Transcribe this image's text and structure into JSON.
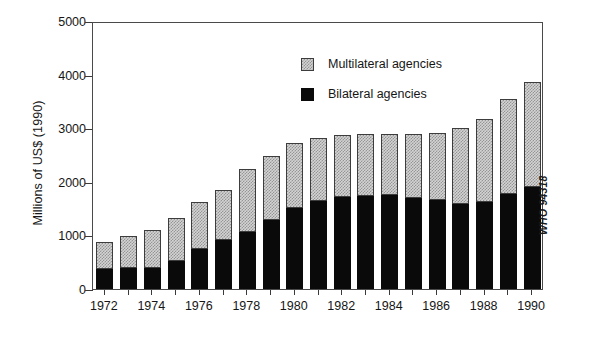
{
  "chart_data": {
    "type": "bar",
    "subtype": "stacked-bar",
    "title": "",
    "xlabel": "",
    "ylabel": "Millions of US$ (1990)",
    "ylim": [
      0,
      5000
    ],
    "ytick_values": [
      0,
      1000,
      2000,
      3000,
      4000,
      5000
    ],
    "ytick_labels": [
      "0",
      "1000",
      "2000",
      "3000",
      "4000",
      "5000"
    ],
    "grid": false,
    "legend_position": "top-center",
    "categories": [
      1972,
      1973,
      1974,
      1975,
      1976,
      1977,
      1978,
      1979,
      1980,
      1981,
      1982,
      1983,
      1984,
      1985,
      1986,
      1987,
      1988,
      1989,
      1990
    ],
    "xtick_labels": [
      "1972",
      "1974",
      "1976",
      "1978",
      "1980",
      "1982",
      "1984",
      "1986",
      "1988",
      "1990"
    ],
    "xtick_categories": [
      1972,
      1974,
      1976,
      1978,
      1980,
      1982,
      1984,
      1986,
      1988,
      1990
    ],
    "series": [
      {
        "name": "Bilateral agencies",
        "color": "#0a0a0a",
        "values": [
          380,
          390,
          400,
          530,
          740,
          910,
          1060,
          1290,
          1520,
          1650,
          1710,
          1740,
          1750,
          1700,
          1660,
          1590,
          1630,
          1770,
          1910
        ]
      },
      {
        "name": "Multilateral agencies",
        "color": "#d3d3d3",
        "values": [
          500,
          600,
          700,
          800,
          880,
          940,
          1180,
          1190,
          1200,
          1170,
          1160,
          1150,
          1140,
          1190,
          1260,
          1420,
          1550,
          1780,
          1960
        ]
      }
    ],
    "totals": [
      880,
      990,
      1100,
      1330,
      1620,
      1850,
      2240,
      2480,
      2720,
      2820,
      2870,
      2890,
      2890,
      2890,
      2920,
      3010,
      3180,
      3550,
      3870
    ],
    "annotations": [
      {
        "name": "source-code",
        "text": "WHO 94318",
        "orientation": "vertical"
      }
    ]
  },
  "legend": {
    "items": [
      {
        "label": "Multilateral agencies",
        "swatch": "multilateral-swatch"
      },
      {
        "label": "Bilateral agencies",
        "swatch": "bilateral-swatch"
      }
    ]
  },
  "source_note": "WHO 94318"
}
